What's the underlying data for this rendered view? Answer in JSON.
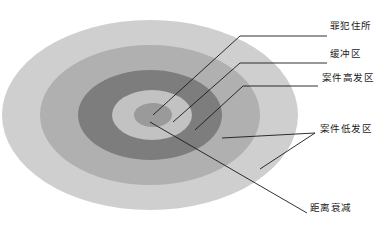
{
  "figure": {
    "kind": "concentric-zone-diagram",
    "background_color": "#ffffff",
    "leader_line_color": "#1a1a1a"
  },
  "zones": [
    {
      "key": "outer_decay",
      "label": "距离衰减",
      "color": "#cfcfcf",
      "rx": 148,
      "ry": 95,
      "cx": 150,
      "cy": 115
    },
    {
      "key": "low_crime",
      "label": "案件低发区",
      "color": "#b0b0b0",
      "rx": 110,
      "ry": 70,
      "cx": 150,
      "cy": 115
    },
    {
      "key": "high_crime",
      "label": "案件高发区",
      "color": "#7d7d7d",
      "rx": 72,
      "ry": 45,
      "cx": 150,
      "cy": 115
    },
    {
      "key": "buffer",
      "label": "缓冲区",
      "color": "#c2c2c2",
      "rx": 40,
      "ry": 25,
      "cx": 152,
      "cy": 115
    },
    {
      "key": "offender_residence",
      "label": "罪犯住所",
      "color": "#9a9a9a",
      "rx": 19,
      "ry": 12,
      "cx": 153,
      "cy": 115
    }
  ],
  "labels": {
    "offender_residence": "罪犯住所",
    "buffer_zone": "缓冲区",
    "high_crime_zone": "案件高发区",
    "low_crime_zone": "案件低发区",
    "distance_decay": "距离衰减"
  },
  "leaders": [
    {
      "name": "leader-offender-residence",
      "points": "153,115 240,36 327,36"
    },
    {
      "name": "leader-buffer-zone",
      "points": "173,122 240,63 327,63"
    },
    {
      "name": "leader-high-crime-zone",
      "points": "195,130 243,86 318,86"
    },
    {
      "name": "leader-low-crime-zone-upper",
      "points": "222,138 315,133"
    },
    {
      "name": "leader-low-crime-zone-lower",
      "points": "260,169 315,133"
    },
    {
      "name": "leader-distance-decay",
      "points": "150,122 307,213"
    }
  ]
}
